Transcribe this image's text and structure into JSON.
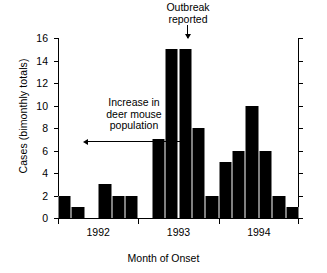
{
  "chart_data": {
    "type": "bar",
    "title": "",
    "xlabel": "Month of Onset",
    "ylabel": "Cases (bimonthly totals)",
    "ylim": [
      0,
      16
    ],
    "ytick_labels": [
      "0",
      "2",
      "4",
      "6",
      "8",
      "10",
      "12",
      "14",
      "16"
    ],
    "ytick_values": [
      0,
      2,
      4,
      6,
      8,
      10,
      12,
      14,
      16
    ],
    "xtick_labels": [
      "1992",
      "1993",
      "1994"
    ],
    "grid": false,
    "legend": null,
    "bar_color": "#000000",
    "categories": [
      "1992-1",
      "1992-2",
      "1992-3",
      "1992-4",
      "1992-5",
      "1992-6",
      "1993-1",
      "1993-2",
      "1993-3",
      "1993-4",
      "1993-5",
      "1993-6",
      "1994-1",
      "1994-2",
      "1994-3",
      "1994-4",
      "1994-5",
      "1994-6"
    ],
    "values": [
      2,
      1,
      0,
      3,
      2,
      2,
      0,
      7,
      15,
      15,
      8,
      2,
      5,
      6,
      10,
      6,
      2,
      1
    ],
    "annotations": [
      {
        "name": "outbreak-reported",
        "text_line1": "Outbreak",
        "text_line2": "reported",
        "marker": "down-arrow"
      },
      {
        "name": "increase-deer-mouse-population",
        "text_line1": "Increase in",
        "text_line2": "deer mouse",
        "text_line3": "population",
        "marker": "double-headed-arrow"
      }
    ]
  }
}
